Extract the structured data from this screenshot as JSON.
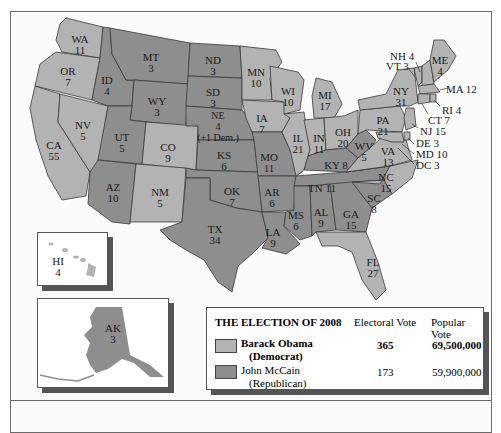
{
  "title": "THE ELECTION OF 2008",
  "colors": {
    "democrat": "#b3b3b3",
    "republican": "#8e8e8e",
    "border": "#3a3a3a"
  },
  "legend": {
    "title": "THE ELECTION OF 2008",
    "columns": [
      "Electoral Vote",
      "Popular Vote"
    ],
    "rows": [
      {
        "candidate": "Barack Obama",
        "party": "(Democrat)",
        "electoral_vote": "365",
        "popular_vote": "69,500,000",
        "bold": true,
        "color": "#b3b3b3"
      },
      {
        "candidate": "John McCain",
        "party": "(Republican)",
        "electoral_vote": "173",
        "popular_vote": "59,900,000",
        "bold": false,
        "color": "#8e8e8e"
      }
    ]
  },
  "states": [
    {
      "abbr": "WA",
      "votes": "11",
      "winner": "dem"
    },
    {
      "abbr": "OR",
      "votes": "7",
      "winner": "dem"
    },
    {
      "abbr": "CA",
      "votes": "55",
      "winner": "dem"
    },
    {
      "abbr": "NV",
      "votes": "5",
      "winner": "dem"
    },
    {
      "abbr": "ID",
      "votes": "4",
      "winner": "rep"
    },
    {
      "abbr": "MT",
      "votes": "3",
      "winner": "rep"
    },
    {
      "abbr": "WY",
      "votes": "3",
      "winner": "rep"
    },
    {
      "abbr": "UT",
      "votes": "5",
      "winner": "rep"
    },
    {
      "abbr": "CO",
      "votes": "9",
      "winner": "dem"
    },
    {
      "abbr": "AZ",
      "votes": "10",
      "winner": "rep"
    },
    {
      "abbr": "NM",
      "votes": "5",
      "winner": "dem"
    },
    {
      "abbr": "ND",
      "votes": "3",
      "winner": "rep"
    },
    {
      "abbr": "SD",
      "votes": "3",
      "winner": "rep"
    },
    {
      "abbr": "NE",
      "votes": "4",
      "note": "(+1 Dem.)",
      "winner": "rep"
    },
    {
      "abbr": "KS",
      "votes": "6",
      "winner": "rep"
    },
    {
      "abbr": "OK",
      "votes": "7",
      "winner": "rep"
    },
    {
      "abbr": "TX",
      "votes": "34",
      "winner": "rep"
    },
    {
      "abbr": "MN",
      "votes": "10",
      "winner": "dem"
    },
    {
      "abbr": "IA",
      "votes": "7",
      "winner": "dem"
    },
    {
      "abbr": "MO",
      "votes": "11",
      "winner": "rep"
    },
    {
      "abbr": "AR",
      "votes": "6",
      "winner": "rep"
    },
    {
      "abbr": "LA",
      "votes": "9",
      "winner": "rep"
    },
    {
      "abbr": "WI",
      "votes": "10",
      "winner": "dem"
    },
    {
      "abbr": "IL",
      "votes": "21",
      "winner": "dem"
    },
    {
      "abbr": "MI",
      "votes": "17",
      "winner": "dem"
    },
    {
      "abbr": "IN",
      "votes": "11",
      "winner": "dem"
    },
    {
      "abbr": "OH",
      "votes": "20",
      "winner": "dem"
    },
    {
      "abbr": "KY",
      "votes": "8",
      "winner": "rep"
    },
    {
      "abbr": "TN",
      "votes": "11",
      "winner": "rep"
    },
    {
      "abbr": "MS",
      "votes": "6",
      "winner": "rep"
    },
    {
      "abbr": "AL",
      "votes": "9",
      "winner": "rep"
    },
    {
      "abbr": "GA",
      "votes": "15",
      "winner": "rep"
    },
    {
      "abbr": "FL",
      "votes": "27",
      "winner": "dem"
    },
    {
      "abbr": "SC",
      "votes": "8",
      "winner": "rep"
    },
    {
      "abbr": "NC",
      "votes": "15",
      "winner": "dem"
    },
    {
      "abbr": "VA",
      "votes": "13",
      "winner": "dem"
    },
    {
      "abbr": "WV",
      "votes": "5",
      "winner": "rep"
    },
    {
      "abbr": "PA",
      "votes": "21",
      "winner": "dem"
    },
    {
      "abbr": "NY",
      "votes": "31",
      "winner": "dem"
    },
    {
      "abbr": "ME",
      "votes": "4",
      "winner": "dem"
    },
    {
      "abbr": "NH",
      "votes": "4",
      "winner": "dem"
    },
    {
      "abbr": "VT",
      "votes": "3",
      "winner": "dem"
    },
    {
      "abbr": "MA",
      "votes": "12",
      "winner": "dem"
    },
    {
      "abbr": "RI",
      "votes": "4",
      "winner": "dem"
    },
    {
      "abbr": "CT",
      "votes": "7",
      "winner": "dem"
    },
    {
      "abbr": "NJ",
      "votes": "15",
      "winner": "dem"
    },
    {
      "abbr": "DE",
      "votes": "3",
      "winner": "dem"
    },
    {
      "abbr": "MD",
      "votes": "10",
      "winner": "dem"
    },
    {
      "abbr": "DC",
      "votes": "3",
      "winner": "dem"
    },
    {
      "abbr": "HI",
      "votes": "4",
      "winner": "dem"
    },
    {
      "abbr": "AK",
      "votes": "3",
      "winner": "rep"
    }
  ],
  "labels": {
    "WA": "WA\n11",
    "OR": "OR\n7",
    "CA": "CA\n55",
    "NV": "NV\n5",
    "ID": "ID\n4",
    "MT": "MT\n3",
    "WY": "WY\n3",
    "UT": "UT\n5",
    "CO": "CO\n9",
    "AZ": "AZ\n10",
    "NM": "NM\n5",
    "ND": "ND\n3",
    "SD": "SD\n3",
    "NE": "NE\n4\n(+1 Dem.)",
    "KS": "KS\n6",
    "OK": "OK\n7",
    "TX": "TX\n34",
    "MN": "MN\n10",
    "IA": "IA\n7",
    "MO": "MO\n11",
    "AR": "AR\n6",
    "LA": "LA\n9",
    "WI": "WI\n10",
    "IL": "IL\n21",
    "MI": "MI\n17",
    "IN": "IN\n11",
    "OH": "OH\n20",
    "KY": "KY 8",
    "TN": "TN 11",
    "MS": "MS\n6",
    "AL": "AL\n9",
    "GA": "GA\n15",
    "FL": "FL\n27",
    "SC": "SC\n8",
    "NC": "NC\n15",
    "VA": "VA\n13",
    "WV": "WV\n5",
    "PA": "PA\n21",
    "NY": "NY\n31",
    "ME": "ME\n4",
    "NH": "NH 4",
    "VT": "VT 3",
    "MA": "MA 12",
    "RI": "RI 4",
    "CT": "CT 7",
    "NJ": "NJ 15",
    "DE": "DE 3",
    "MD": "MD 10",
    "DC": "DC 3",
    "HI": "HI\n4",
    "AK": "AK\n3"
  }
}
